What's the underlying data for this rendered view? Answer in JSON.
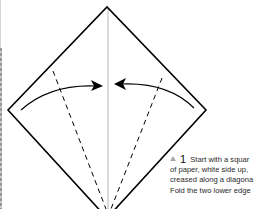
{
  "step": {
    "number": "1",
    "lines": [
      "Start with a squar",
      "of paper, white side up,",
      "creased along a diagona",
      "Fold the two lower edge"
    ]
  },
  "diagram": {
    "shape": "square-on-point",
    "outline_color": "#000000",
    "crease_color": "#b5b5b5",
    "arrow_color": "#000000",
    "fold_lines": "dashed",
    "arrows": [
      "left-edge-to-center",
      "right-edge-to-center"
    ]
  },
  "icons": {
    "step_marker": "triangle-up-icon"
  }
}
